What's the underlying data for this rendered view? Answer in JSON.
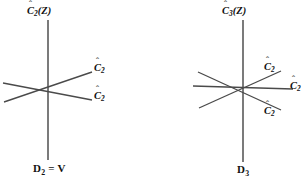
{
  "figure": {
    "background_color": "#ffffff",
    "line_color": "#4a4a4a",
    "text_color": "#111111",
    "diagrams": [
      {
        "id": "left",
        "group_label": "D",
        "group_label_sub": "2",
        "group_label_suffix": " = V",
        "principal_axis": {
          "label_base": "C",
          "label_sub": "2",
          "label_suffix": "(Z)",
          "hat": "ˆ"
        },
        "secondary_axes": [
          {
            "label_base": "C",
            "label_sub": "2",
            "hat": "ˆ"
          },
          {
            "label_base": "C",
            "label_sub": "2",
            "hat": "ˆ"
          }
        ]
      },
      {
        "id": "right",
        "group_label": "D",
        "group_label_sub": "3",
        "group_label_suffix": "",
        "principal_axis": {
          "label_base": "C",
          "label_sub": "3",
          "label_suffix": "(Z)",
          "hat": "ˆ"
        },
        "secondary_axes": [
          {
            "label_base": "C",
            "label_sub": "2",
            "hat": "ˆ"
          },
          {
            "label_base": "C",
            "label_sub": "2",
            "hat": "ˆ"
          },
          {
            "label_base": "C",
            "label_sub": "2",
            "hat": "ˆ"
          }
        ]
      }
    ]
  }
}
